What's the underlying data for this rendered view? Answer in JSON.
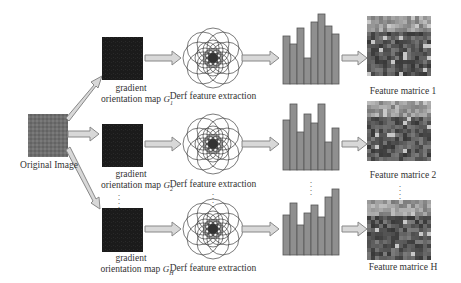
{
  "diagram": {
    "original": {
      "label": "Original Image",
      "fill": "#6f6f6f"
    },
    "rows": [
      {
        "id": "1",
        "map_label_line1": "gradient",
        "map_label_line2": "orientation map",
        "map_symbol": "G",
        "map_subscript": "1",
        "derf_label": "Derf feature extraction",
        "histogram": [
          48,
          40,
          56,
          26,
          62,
          70,
          58,
          50
        ],
        "matrix_label": "Feature  matrice 1"
      },
      {
        "id": "2",
        "map_label_line1": "gradient",
        "map_label_line2": "orientation map",
        "map_symbol": "G",
        "map_subscript": "2",
        "derf_label": "Derf feature extraction",
        "histogram": [
          50,
          66,
          38,
          56,
          47,
          66,
          28,
          42
        ],
        "matrix_label": "Feature  matrice 2"
      },
      {
        "id": "H",
        "map_label_line1": "gradient",
        "map_label_line2": "orientation map",
        "map_symbol": "G",
        "map_subscript": "H",
        "derf_label": "Derf feature extraction",
        "histogram": [
          40,
          52,
          30,
          42,
          50,
          38,
          58,
          66
        ],
        "matrix_label": "Feature  matrice H"
      }
    ],
    "ellipsis": "⋮",
    "colors": {
      "gradient_map": "#1a1a1a",
      "arrow_fill": "#d8d8d8",
      "arrow_stroke": "#888888",
      "bar_fill": "#8f8f8f",
      "bar_stroke": "#555555",
      "circle_stroke": "#444444"
    }
  }
}
